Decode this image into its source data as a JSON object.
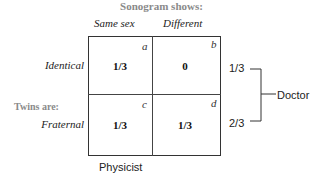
{
  "title": "Sonogram shows:",
  "columns": [
    "Same sex",
    "Different"
  ],
  "row_group_label": "Twins are:",
  "rows": [
    {
      "label": "Identical",
      "cells": [
        {
          "corner": "a",
          "value": "1/3"
        },
        {
          "corner": "b",
          "value": "0"
        }
      ],
      "marginal": "1/3"
    },
    {
      "label": "Fraternal",
      "cells": [
        {
          "corner": "c",
          "value": "1/3"
        },
        {
          "corner": "d",
          "value": "1/3"
        }
      ],
      "marginal": "2/3"
    }
  ],
  "bracket_label": "Doctor",
  "bottom_label": "Physicist"
}
